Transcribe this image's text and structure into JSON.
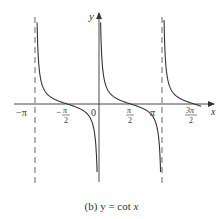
{
  "caption": {
    "prefix": "(b) y = cot ",
    "var": "x"
  },
  "axes": {
    "x_label": "x",
    "y_label": "y",
    "origin_label": "0"
  },
  "ticks": {
    "neg_pi": "−π",
    "neg_half_pi_num": "π",
    "neg_half_pi_den": "2",
    "neg_sign": "−",
    "half_pi_num": "π",
    "half_pi_den": "2",
    "pi": "π",
    "three_half_pi_num": "3π",
    "three_half_pi_den": "2"
  },
  "colors": {
    "curve": "#333333",
    "axis": "#333333",
    "asymptote": "#555555"
  },
  "chart_data": {
    "type": "line",
    "title": "(b) y = cot x",
    "xlabel": "x",
    "ylabel": "y",
    "function": "cot(x)",
    "xlim": [
      -3.6,
      5.5
    ],
    "x_ticks": [
      "-π",
      "-π/2",
      "0",
      "π/2",
      "π",
      "3π/2"
    ],
    "x_tick_values": [
      -3.1416,
      -1.5708,
      0,
      1.5708,
      3.1416,
      4.7124
    ],
    "vertical_asymptotes": [
      -3.1416,
      0,
      3.1416
    ],
    "asymptote_style": "dashed (at x = -π and x = π; x = 0 coincides with y-axis)",
    "series": [
      {
        "name": "branch (-π, 0)",
        "x": [
          -3.06,
          -2.6,
          -2.1,
          -1.5708,
          -1.0,
          -0.5,
          -0.08
        ],
        "y": [
          12.4,
          1.67,
          0.58,
          0,
          -0.64,
          -1.83,
          -12.4
        ]
      },
      {
        "name": "branch (0, π)",
        "x": [
          0.08,
          0.5,
          1.0,
          1.5708,
          2.1,
          2.6,
          3.06
        ],
        "y": [
          12.4,
          1.83,
          0.64,
          0,
          -0.58,
          -1.67,
          -12.4
        ]
      },
      {
        "name": "branch (π, 3π/2+)",
        "x": [
          3.22,
          3.7,
          4.2,
          4.7124,
          5.0
        ],
        "y": [
          12.4,
          1.6,
          0.55,
          0,
          -0.29
        ]
      }
    ],
    "x_intercepts": [
      -1.5708,
      1.5708,
      4.7124
    ],
    "grid": false,
    "legend": null
  }
}
